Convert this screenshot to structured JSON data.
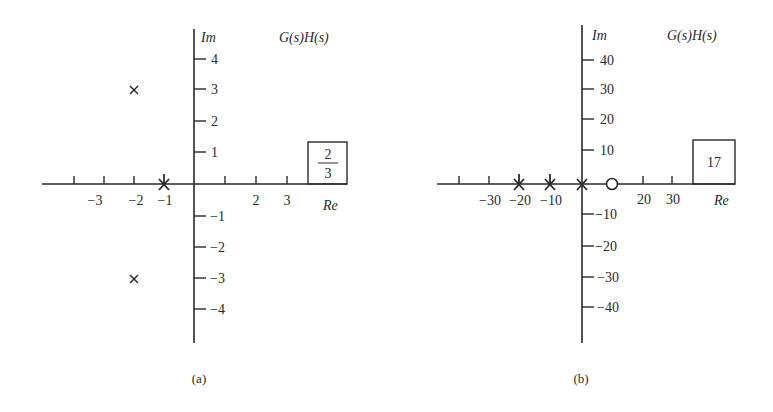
{
  "figure": {
    "panels": [
      {
        "id": "a",
        "caption": "(a)",
        "title": "G(s)H(s)",
        "im_label": "Im",
        "re_label": "Re",
        "gain_box": {
          "numerator": "2",
          "denominator": "3"
        },
        "re_ticks": [
          {
            "x": 74,
            "label": ""
          },
          {
            "x": 104,
            "label": "-3"
          },
          {
            "x": 134,
            "label": "-2"
          },
          {
            "x": 164,
            "label": "-1"
          },
          {
            "x": 225,
            "label": ""
          },
          {
            "x": 256,
            "label": "2"
          },
          {
            "x": 287,
            "label": "3"
          }
        ],
        "im_ticks": [
          {
            "y": 59,
            "label": "4"
          },
          {
            "y": 89,
            "label": "3"
          },
          {
            "y": 121,
            "label": "2"
          },
          {
            "y": 152,
            "label": "1"
          },
          {
            "y": 216,
            "label": "-1"
          },
          {
            "y": 247,
            "label": "-2"
          },
          {
            "y": 278,
            "label": "-3"
          },
          {
            "y": 309,
            "label": "-4"
          }
        ],
        "poles": [
          {
            "re": -2,
            "im": 3,
            "symbol": "x"
          },
          {
            "re": -2,
            "im": -3,
            "symbol": "x"
          },
          {
            "re": -1,
            "im": 0,
            "symbol": "x"
          }
        ],
        "zeros": []
      },
      {
        "id": "b",
        "caption": "(b)",
        "title": "G(s)H(s)",
        "im_label": "Im",
        "re_label": "Re",
        "gain_box": {
          "value": "17"
        },
        "re_ticks": [
          {
            "x": 459,
            "label": ""
          },
          {
            "x": 489,
            "label": "-30"
          },
          {
            "x": 519,
            "label": "-20"
          },
          {
            "x": 550,
            "label": "-10"
          },
          {
            "x": 643,
            "label": "20"
          },
          {
            "x": 672,
            "label": "30"
          }
        ],
        "im_ticks": [
          {
            "y": 60,
            "label": "40"
          },
          {
            "y": 89,
            "label": "30"
          },
          {
            "y": 119,
            "label": "20"
          },
          {
            "y": 150,
            "label": "10"
          },
          {
            "y": 214,
            "label": "-10"
          },
          {
            "y": 246,
            "label": "-20"
          },
          {
            "y": 277,
            "label": "-30"
          },
          {
            "y": 307,
            "label": "-40"
          }
        ],
        "poles": [
          {
            "re": -20,
            "im": 0,
            "symbol": "x"
          },
          {
            "re": -10,
            "im": 0,
            "symbol": "x"
          },
          {
            "re": 0,
            "im": 0,
            "symbol": "x"
          }
        ],
        "zeros": [
          {
            "re": 10,
            "im": 0,
            "symbol": "o"
          }
        ]
      }
    ]
  }
}
